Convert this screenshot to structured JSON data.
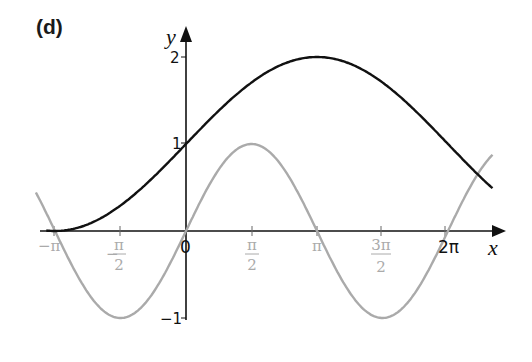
{
  "chart_data": {
    "type": "line",
    "title": "(d)",
    "xlabel": "x",
    "ylabel": "y",
    "xlim": [
      -3.6,
      7.4
    ],
    "ylim": [
      -1.1,
      2.2
    ],
    "grid": false,
    "legend": null,
    "x_ticks": [
      {
        "value": -3.14159,
        "label": "−π",
        "color": "#aaaaaa"
      },
      {
        "value": -1.5708,
        "label_num": "π",
        "label_den": "2",
        "sign": "−",
        "color": "#aaaaaa"
      },
      {
        "value": 0,
        "label": "0",
        "color": "#111111"
      },
      {
        "value": 1.5708,
        "label_num": "π",
        "label_den": "2",
        "color": "#aaaaaa"
      },
      {
        "value": 3.14159,
        "label": "π",
        "color": "#aaaaaa"
      },
      {
        "value": 4.71239,
        "label_num": "3π",
        "label_den": "2",
        "color": "#aaaaaa"
      },
      {
        "value": 6.28319,
        "label": "2π",
        "color": "#111111"
      }
    ],
    "y_ticks": [
      {
        "value": 2,
        "label": "2"
      },
      {
        "value": 1,
        "label": "1"
      },
      {
        "value": -1,
        "label": "−1"
      }
    ],
    "series": [
      {
        "name": "y = 1 + sin(x/2)",
        "color": "#111111",
        "x_range": [
          -3.35,
          7.35
        ],
        "x": [
          -3.14,
          -1.57,
          0,
          1.57,
          3.14,
          4.71,
          6.28,
          7.35
        ],
        "values": [
          0,
          0.29,
          1,
          1.71,
          2,
          1.71,
          1,
          0.48
        ]
      },
      {
        "name": "y = sin(x)",
        "color": "#aaaaaa",
        "x_range": [
          -3.6,
          7.35
        ],
        "x": [
          -3.14,
          -1.57,
          0,
          1.57,
          3.14,
          4.71,
          6.28,
          7.35
        ],
        "values": [
          0,
          -1,
          0,
          1,
          0,
          -1,
          0,
          0.88
        ]
      }
    ]
  },
  "labels": {
    "part": "(d)",
    "x_axis": "x",
    "y_axis": "y",
    "zero": "0",
    "two_pi": "2π",
    "neg_pi": "−π",
    "pi": "π",
    "neg_half_pi_sign": "−",
    "half_pi_num": "π",
    "half_pi_den": "2",
    "three_half_pi_num": "3π",
    "three_half_pi_den": "2",
    "y_two": "2",
    "y_one": "1",
    "y_neg_one": "−1"
  }
}
